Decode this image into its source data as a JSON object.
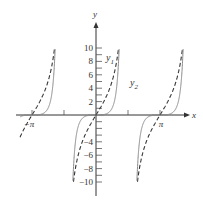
{
  "chart_data": {
    "type": "line",
    "title": "",
    "xlabel": "x",
    "ylabel": "y",
    "xlim": [
      -3.3,
      3.6
    ],
    "ylim": [
      -11.5,
      14
    ],
    "x_tick_labels": [
      "-π",
      "π"
    ],
    "x_ticks": [
      -3.14159,
      -1.5708,
      1.5708,
      3.14159
    ],
    "y_tick_labels": [
      "10",
      "8",
      "6",
      "4",
      "2",
      "-4",
      "-6",
      "-8",
      "-10"
    ],
    "y_ticks": [
      10,
      9,
      8,
      7,
      6,
      5,
      4,
      3,
      2,
      1,
      -1,
      -2,
      -3,
      -4,
      -5,
      -6,
      -7,
      -8,
      -9,
      -10
    ],
    "grid": false,
    "series": [
      {
        "name": "y1",
        "style": "dashed",
        "function": "5*tan(x)",
        "color": "#333333"
      },
      {
        "name": "y2",
        "style": "solid",
        "function": "tan(x)^3",
        "color": "#888888"
      }
    ],
    "annotations": [
      {
        "text": "y1",
        "near": [
          1.0,
          8.5
        ]
      },
      {
        "text": "y2",
        "near": [
          1.75,
          4.8
        ]
      }
    ]
  },
  "labels": {
    "x_axis": "x",
    "y_axis": "y",
    "neg_pi": "−π",
    "pi": "π",
    "y1": "y",
    "y1_sub": "1",
    "y2": "y",
    "y2_sub": "2"
  }
}
